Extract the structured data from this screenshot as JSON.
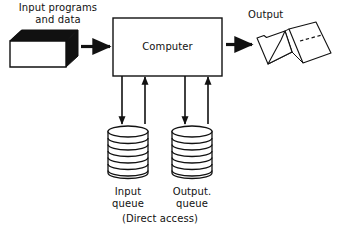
{
  "figure": {
    "type": "block-flow-diagram",
    "background_color": "#ffffff",
    "line_color": "#111111",
    "text_color": "#111111"
  },
  "labels": {
    "input_source_line1": "Input programs",
    "input_source_line2": "and data",
    "computer": "Computer",
    "output": "Output",
    "input_queue_line1": "Input",
    "input_queue_line2": "queue",
    "output_queue_line1": "Output.",
    "output_queue_line2": "queue",
    "direct_access": "(Direct access)"
  },
  "nodes": [
    {
      "id": "card-deck",
      "kind": "card-deck-3d",
      "label_ref": "input_source_line1",
      "x": 10,
      "y": 30,
      "width": 68,
      "height": 37,
      "fill": "#ffffff",
      "shade": "#111111"
    },
    {
      "id": "computer-box",
      "kind": "rectangle",
      "label_ref": "computer",
      "x": 113,
      "y": 18,
      "width": 109,
      "height": 58,
      "fill": "#ffffff",
      "stroke": "#111111"
    },
    {
      "id": "output-paper",
      "kind": "fanfold-paper",
      "label_ref": "output",
      "x": 255,
      "y": 22,
      "width": 78,
      "height": 50,
      "fill": "#ffffff",
      "stroke": "#111111"
    },
    {
      "id": "input-queue-disk",
      "kind": "disk-pack",
      "label_ref": "input_queue_line1",
      "x": 108,
      "y": 127,
      "width": 40,
      "height": 51,
      "platters": 7,
      "fill": "#ffffff",
      "stroke": "#111111"
    },
    {
      "id": "output-queue-disk",
      "kind": "disk-pack",
      "label_ref": "output_queue_line1",
      "x": 172,
      "y": 127,
      "width": 40,
      "height": 51,
      "platters": 7,
      "fill": "#ffffff",
      "stroke": "#111111"
    }
  ],
  "arrows": [
    {
      "id": "deck-to-computer",
      "direction": "right",
      "from": "card-deck",
      "to": "computer-box",
      "thick": true
    },
    {
      "id": "computer-to-output",
      "direction": "right",
      "from": "computer-box",
      "to": "output-paper",
      "thick": true
    },
    {
      "id": "computer-to-input-queue",
      "direction": "down",
      "from": "computer-box",
      "to": "input-queue-disk",
      "thick": false
    },
    {
      "id": "input-queue-to-computer",
      "direction": "up",
      "from": "input-queue-disk",
      "to": "computer-box",
      "thick": false
    },
    {
      "id": "computer-to-output-queue",
      "direction": "down",
      "from": "computer-box",
      "to": "output-queue-disk",
      "thick": false
    },
    {
      "id": "output-queue-to-computer",
      "direction": "up",
      "from": "output-queue-disk",
      "to": "computer-box",
      "thick": false
    }
  ]
}
